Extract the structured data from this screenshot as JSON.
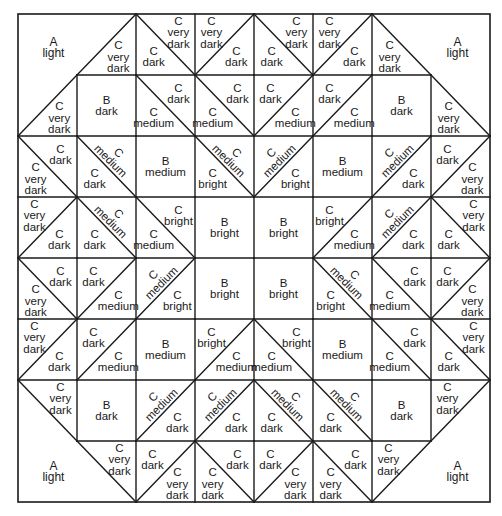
{
  "diagram": {
    "rows": 8,
    "cols": 8,
    "corner_pieces": [
      {
        "corner": "top-left",
        "letter": "A",
        "shade": "light"
      },
      {
        "corner": "top-right",
        "letter": "A",
        "shade": "light"
      },
      {
        "corner": "bottom-left",
        "letter": "A",
        "shade": "light"
      },
      {
        "corner": "bottom-right",
        "letter": "A",
        "shade": "light"
      }
    ],
    "cells": [
      [
        {
          "type": "corner"
        },
        {
          "type": "corner-edge",
          "diag": "/",
          "b": {
            "letter": "C",
            "shade": "very dark"
          }
        },
        {
          "type": "tri",
          "diag": "\\",
          "a": {
            "letter": "C",
            "shade": "very dark"
          },
          "b": {
            "letter": "C",
            "shade": "dark"
          }
        },
        {
          "type": "tri",
          "diag": "/",
          "a": {
            "letter": "C",
            "shade": "very dark"
          },
          "b": {
            "letter": "C",
            "shade": "dark"
          }
        },
        {
          "type": "tri",
          "diag": "\\",
          "a": {
            "letter": "C",
            "shade": "very dark"
          },
          "b": {
            "letter": "C",
            "shade": "dark"
          }
        },
        {
          "type": "tri",
          "diag": "/",
          "a": {
            "letter": "C",
            "shade": "very dark"
          },
          "b": {
            "letter": "C",
            "shade": "dark"
          }
        },
        {
          "type": "corner-edge",
          "diag": "\\",
          "b": {
            "letter": "C",
            "shade": "very dark"
          }
        },
        {
          "type": "corner"
        }
      ],
      [
        {
          "type": "corner-edge",
          "diag": "/",
          "b": {
            "letter": "C",
            "shade": "very dark"
          }
        },
        {
          "type": "square",
          "a": {
            "letter": "B",
            "shade": "dark"
          }
        },
        {
          "type": "tri",
          "diag": "\\",
          "a": {
            "letter": "C",
            "shade": "dark"
          },
          "b": {
            "letter": "C",
            "shade": "medium"
          }
        },
        {
          "type": "tri",
          "diag": "\\",
          "a": {
            "letter": "C",
            "shade": "dark"
          },
          "b": {
            "letter": "C",
            "shade": "medium"
          }
        },
        {
          "type": "tri",
          "diag": "/",
          "a": {
            "letter": "C",
            "shade": "dark"
          },
          "b": {
            "letter": "C",
            "shade": "medium"
          }
        },
        {
          "type": "tri",
          "diag": "/",
          "a": {
            "letter": "C",
            "shade": "dark"
          },
          "b": {
            "letter": "C",
            "shade": "medium"
          }
        },
        {
          "type": "square",
          "a": {
            "letter": "B",
            "shade": "dark"
          }
        },
        {
          "type": "corner-edge",
          "diag": "\\",
          "b": {
            "letter": "C",
            "shade": "very dark"
          }
        }
      ],
      [
        {
          "type": "tri",
          "diag": "\\",
          "a": {
            "letter": "C",
            "shade": "dark"
          },
          "b": {
            "letter": "C",
            "shade": "very dark"
          }
        },
        {
          "type": "tri",
          "diag": "\\",
          "a": {
            "letter": "C",
            "shade": "medium",
            "rotated": true
          },
          "b": {
            "letter": "C",
            "shade": "dark"
          }
        },
        {
          "type": "square",
          "a": {
            "letter": "B",
            "shade": "medium"
          }
        },
        {
          "type": "tri",
          "diag": "\\",
          "a": {
            "letter": "C",
            "shade": "medium",
            "rotated": true
          },
          "b": {
            "letter": "C",
            "shade": "bright"
          }
        },
        {
          "type": "tri",
          "diag": "/",
          "a": {
            "letter": "C",
            "shade": "medium",
            "rotated": true
          },
          "b": {
            "letter": "C",
            "shade": "bright"
          }
        },
        {
          "type": "square",
          "a": {
            "letter": "B",
            "shade": "medium"
          }
        },
        {
          "type": "tri",
          "diag": "/",
          "a": {
            "letter": "C",
            "shade": "medium",
            "rotated": true
          },
          "b": {
            "letter": "C",
            "shade": "dark"
          }
        },
        {
          "type": "tri",
          "diag": "/",
          "a": {
            "letter": "C",
            "shade": "dark"
          },
          "b": {
            "letter": "C",
            "shade": "very dark"
          }
        }
      ],
      [
        {
          "type": "tri",
          "diag": "/",
          "a": {
            "letter": "C",
            "shade": "very dark"
          },
          "b": {
            "letter": "C",
            "shade": "dark"
          }
        },
        {
          "type": "tri",
          "diag": "\\",
          "a": {
            "letter": "C",
            "shade": "medium",
            "rotated": true
          },
          "b": {
            "letter": "C",
            "shade": "dark"
          }
        },
        {
          "type": "tri",
          "diag": "\\",
          "a": {
            "letter": "C",
            "shade": "bright"
          },
          "b": {
            "letter": "C",
            "shade": "medium"
          }
        },
        {
          "type": "square",
          "a": {
            "letter": "B",
            "shade": "bright"
          }
        },
        {
          "type": "square",
          "a": {
            "letter": "B",
            "shade": "bright"
          }
        },
        {
          "type": "tri",
          "diag": "/",
          "a": {
            "letter": "C",
            "shade": "bright"
          },
          "b": {
            "letter": "C",
            "shade": "medium"
          }
        },
        {
          "type": "tri",
          "diag": "/",
          "a": {
            "letter": "C",
            "shade": "medium",
            "rotated": true
          },
          "b": {
            "letter": "C",
            "shade": "dark"
          }
        },
        {
          "type": "tri",
          "diag": "\\",
          "a": {
            "letter": "C",
            "shade": "very dark"
          },
          "b": {
            "letter": "C",
            "shade": "dark"
          }
        }
      ],
      [
        {
          "type": "tri",
          "diag": "\\",
          "a": {
            "letter": "C",
            "shade": "dark"
          },
          "b": {
            "letter": "C",
            "shade": "very dark"
          }
        },
        {
          "type": "tri",
          "diag": "/",
          "a": {
            "letter": "C",
            "shade": "dark"
          },
          "b": {
            "letter": "C",
            "shade": "medium"
          }
        },
        {
          "type": "tri",
          "diag": "/",
          "a": {
            "letter": "C",
            "shade": "medium",
            "rotated": true
          },
          "b": {
            "letter": "C",
            "shade": "bright"
          }
        },
        {
          "type": "square",
          "a": {
            "letter": "B",
            "shade": "bright"
          }
        },
        {
          "type": "square",
          "a": {
            "letter": "B",
            "shade": "bright"
          }
        },
        {
          "type": "tri",
          "diag": "\\",
          "a": {
            "letter": "C",
            "shade": "medium",
            "rotated": true
          },
          "b": {
            "letter": "C",
            "shade": "bright"
          }
        },
        {
          "type": "tri",
          "diag": "\\",
          "a": {
            "letter": "C",
            "shade": "dark"
          },
          "b": {
            "letter": "C",
            "shade": "medium"
          }
        },
        {
          "type": "tri",
          "diag": "/",
          "a": {
            "letter": "C",
            "shade": "dark"
          },
          "b": {
            "letter": "C",
            "shade": "very dark"
          }
        }
      ],
      [
        {
          "type": "tri",
          "diag": "/",
          "a": {
            "letter": "C",
            "shade": "very dark"
          },
          "b": {
            "letter": "C",
            "shade": "dark"
          }
        },
        {
          "type": "tri",
          "diag": "/",
          "a": {
            "letter": "C",
            "shade": "dark"
          },
          "b": {
            "letter": "C",
            "shade": "medium"
          }
        },
        {
          "type": "square",
          "a": {
            "letter": "B",
            "shade": "medium"
          }
        },
        {
          "type": "tri",
          "diag": "/",
          "a": {
            "letter": "C",
            "shade": "bright"
          },
          "b": {
            "letter": "C",
            "shade": "medium"
          }
        },
        {
          "type": "tri",
          "diag": "\\",
          "a": {
            "letter": "C",
            "shade": "bright"
          },
          "b": {
            "letter": "C",
            "shade": "medium"
          }
        },
        {
          "type": "square",
          "a": {
            "letter": "B",
            "shade": "medium"
          }
        },
        {
          "type": "tri",
          "diag": "\\",
          "a": {
            "letter": "C",
            "shade": "dark"
          },
          "b": {
            "letter": "C",
            "shade": "medium"
          }
        },
        {
          "type": "tri",
          "diag": "\\",
          "a": {
            "letter": "C",
            "shade": "very dark"
          },
          "b": {
            "letter": "C",
            "shade": "dark"
          }
        }
      ],
      [
        {
          "type": "corner-edge",
          "diag": "\\",
          "a": {
            "letter": "C",
            "shade": "very dark"
          }
        },
        {
          "type": "square",
          "a": {
            "letter": "B",
            "shade": "dark"
          }
        },
        {
          "type": "tri",
          "diag": "/",
          "a": {
            "letter": "C",
            "shade": "medium",
            "rotated": true
          },
          "b": {
            "letter": "C",
            "shade": "dark"
          }
        },
        {
          "type": "tri",
          "diag": "/",
          "a": {
            "letter": "C",
            "shade": "medium",
            "rotated": true
          },
          "b": {
            "letter": "C",
            "shade": "dark"
          }
        },
        {
          "type": "tri",
          "diag": "\\",
          "a": {
            "letter": "C",
            "shade": "medium",
            "rotated": true
          },
          "b": {
            "letter": "C",
            "shade": "dark"
          }
        },
        {
          "type": "tri",
          "diag": "\\",
          "a": {
            "letter": "C",
            "shade": "medium",
            "rotated": true
          },
          "b": {
            "letter": "C",
            "shade": "dark"
          }
        },
        {
          "type": "square",
          "a": {
            "letter": "B",
            "shade": "dark"
          }
        },
        {
          "type": "corner-edge",
          "diag": "/",
          "a": {
            "letter": "C",
            "shade": "very dark"
          }
        }
      ],
      [
        {
          "type": "corner"
        },
        {
          "type": "corner-edge",
          "diag": "\\",
          "a": {
            "letter": "C",
            "shade": "very dark"
          }
        },
        {
          "type": "tri",
          "diag": "/",
          "a": {
            "letter": "C",
            "shade": "dark"
          },
          "b": {
            "letter": "C",
            "shade": "very dark"
          }
        },
        {
          "type": "tri",
          "diag": "\\",
          "a": {
            "letter": "C",
            "shade": "dark"
          },
          "b": {
            "letter": "C",
            "shade": "very dark"
          }
        },
        {
          "type": "tri",
          "diag": "/",
          "a": {
            "letter": "C",
            "shade": "dark"
          },
          "b": {
            "letter": "C",
            "shade": "very dark"
          }
        },
        {
          "type": "tri",
          "diag": "\\",
          "a": {
            "letter": "C",
            "shade": "dark"
          },
          "b": {
            "letter": "C",
            "shade": "very dark"
          }
        },
        {
          "type": "corner-edge",
          "diag": "/",
          "a": {
            "letter": "C",
            "shade": "very dark"
          }
        },
        {
          "type": "corner"
        }
      ]
    ]
  }
}
